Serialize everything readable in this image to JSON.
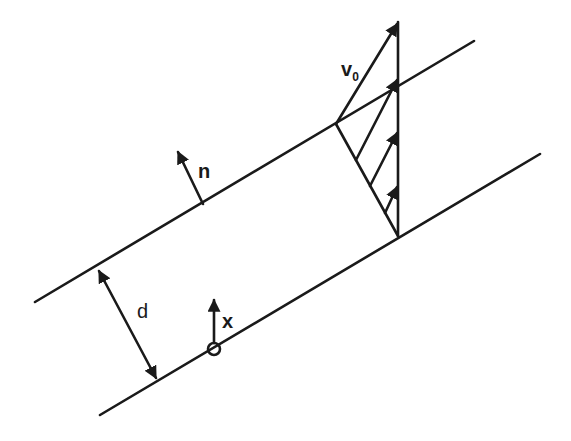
{
  "diagram": {
    "type": "channel flow schematic (inclined film / Couette-type velocity profile)",
    "labels": {
      "velocity": "v",
      "velocity_sub": "0",
      "normal": "n",
      "thickness": "d",
      "coordinate": "x"
    },
    "colors": {
      "stroke": "#1a1a1a",
      "background": "#ffffff"
    },
    "elements": [
      {
        "name": "upper-wall",
        "from": [
          35,
          302
        ],
        "to": [
          474,
          41
        ]
      },
      {
        "name": "lower-wall",
        "from": [
          100,
          415
        ],
        "to": [
          540,
          154
        ]
      },
      {
        "name": "velocity-profile",
        "shape": "triangle",
        "vertices": [
          [
            336,
            124
          ],
          [
            398,
            22
          ],
          [
            398,
            236
          ]
        ],
        "arrows": 4
      },
      {
        "name": "normal-vector",
        "from": [
          203,
          204
        ],
        "to": [
          178,
          152
        ]
      },
      {
        "name": "thickness-dimension",
        "from": [
          97,
          268
        ],
        "to": [
          158,
          381
        ]
      },
      {
        "name": "x-axis-arrow",
        "from": [
          214,
          349
        ],
        "to": [
          214,
          300
        ]
      },
      {
        "name": "origin-circle",
        "center": [
          214,
          349
        ],
        "r": 6
      }
    ]
  }
}
